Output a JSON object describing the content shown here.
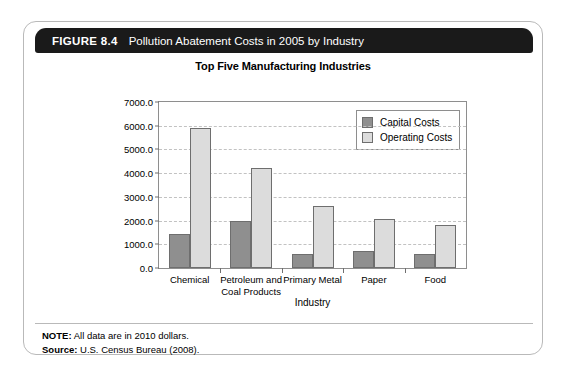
{
  "figure": {
    "number": "FIGURE 8.4",
    "title": "Pollution Abatement Costs in 2005 by Industry"
  },
  "footer": {
    "note_key": "NOTE:",
    "note_value": "All data are in 2010 dollars.",
    "source_key": "Source:",
    "source_value": "U.S. Census Bureau (2008)."
  },
  "colors": {
    "capital": "#8f8f8f",
    "operating": "#dcdcdc",
    "header_bar": "#1a1a1a",
    "frame": "#b9b9b9",
    "gridline": "#c2c2c2"
  },
  "chart_data": {
    "type": "bar",
    "title": "Top Five Manufacturing Industries",
    "xlabel": "Industry",
    "ylabel": "Millions of 2010 Dollars",
    "ylim": [
      0,
      7000
    ],
    "ytick_step": 1000,
    "yticks": [
      "0.0",
      "1000.0",
      "2000.0",
      "3000.0",
      "4000.0",
      "5000.0",
      "6000.0",
      "7000.0"
    ],
    "ytick_values": [
      0,
      1000,
      2000,
      3000,
      4000,
      5000,
      6000,
      7000
    ],
    "grid": true,
    "legend_position": "top-right-inside",
    "categories": [
      "Chemical",
      "Petroleum and Coal Products",
      "Primary Metal",
      "Paper",
      "Food"
    ],
    "series": [
      {
        "name": "Capital Costs",
        "values": [
          1450,
          2000,
          600,
          700,
          570
        ]
      },
      {
        "name": "Operating Costs",
        "values": [
          5900,
          4200,
          2600,
          2080,
          1820
        ]
      }
    ]
  }
}
